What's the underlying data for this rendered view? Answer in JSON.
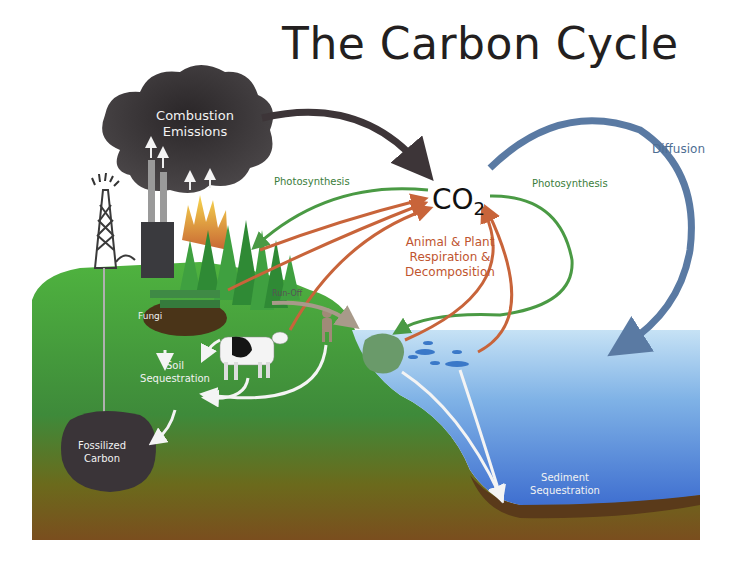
{
  "title": "The Carbon Cycle",
  "center": {
    "label": "CO",
    "subscript": "2"
  },
  "labels": {
    "combustion_line1": "Combustion",
    "combustion_line2": "Emissions",
    "photosynthesis_left": "Photosynthesis",
    "photosynthesis_right": "Photosynthesis",
    "diffusion": "Diffusion",
    "respiration_line1": "Animal & Plant",
    "respiration_line2": "Respiration &",
    "respiration_line3": "Decomposition",
    "runoff": "Run-Off",
    "fungi": "Fungi",
    "soil_line1": "Soil",
    "soil_line2": "Sequestration",
    "fossil_line1": "Fossilized",
    "fossil_line2": "Carbon",
    "sediment_line1": "Sediment",
    "sediment_line2": "Sequestration"
  },
  "colors": {
    "combustion_arrow": "#3d3538",
    "diffusion_arrow": "#5a7aa3",
    "photosynthesis_arrow": "#4a9a44",
    "respiration_arrow": "#c8643a",
    "land": "#4aa83c",
    "water": "#4f86d6",
    "soil": "#7a5a1e"
  }
}
